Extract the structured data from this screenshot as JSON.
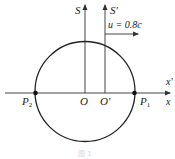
{
  "diagram": {
    "frames": {
      "s_label": "S",
      "s_prime_label": "S′",
      "velocity_label": "u = 0.8c"
    },
    "axes": {
      "x_label": "x",
      "x_prime_label": "x′"
    },
    "points": {
      "p1": "P",
      "p1_sub": "1",
      "p2": "P",
      "p2_sub": "2",
      "origin": "O",
      "origin_prime": "O′"
    },
    "caption": "图 1",
    "colors": {
      "line": "#333333",
      "circle": "#222222",
      "point": "#111111"
    }
  }
}
